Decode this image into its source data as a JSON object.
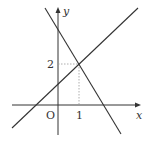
{
  "diagram": {
    "type": "coordinate-graph",
    "axes": {
      "x_label": "x",
      "y_label": "y",
      "origin_label": "O"
    },
    "ticks": {
      "x_tick_label": "1",
      "y_tick_label": "2"
    },
    "intersection_point": {
      "x": 1,
      "y": 2
    },
    "lines": [
      {
        "name": "increasing-line",
        "slope": "positive"
      },
      {
        "name": "decreasing-line",
        "slope": "negative"
      }
    ],
    "colors": {
      "line": "#333333",
      "guide": "#999999",
      "background": "#ffffff"
    }
  }
}
